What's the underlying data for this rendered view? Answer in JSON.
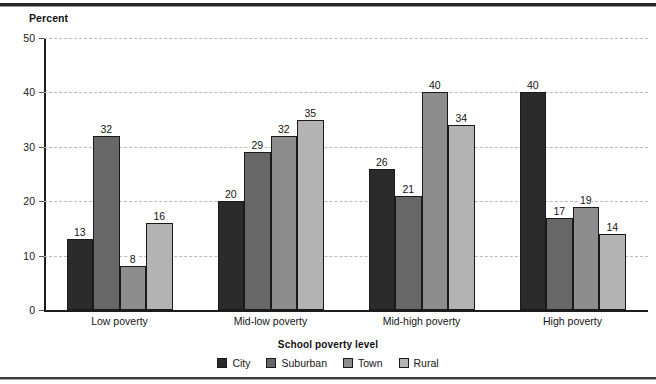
{
  "chart_data": {
    "type": "bar",
    "title": "",
    "ylabel": "Percent",
    "xlabel": "School poverty level",
    "ylim": [
      0,
      50
    ],
    "yticks": [
      0,
      10,
      20,
      30,
      40,
      50
    ],
    "grid": "horizontal-dashed",
    "legend_position": "bottom-center",
    "legend_title": "School poverty level",
    "categories": [
      "Low poverty",
      "Mid-low poverty",
      "Mid-high poverty",
      "High poverty"
    ],
    "series": [
      {
        "name": "City",
        "color": "#2b2b2b",
        "values": [
          13,
          20,
          26,
          40
        ]
      },
      {
        "name": "Suburban",
        "color": "#676767",
        "values": [
          32,
          29,
          21,
          17
        ]
      },
      {
        "name": "Town",
        "color": "#8d8d8d",
        "values": [
          8,
          32,
          40,
          19
        ]
      },
      {
        "name": "Rural",
        "color": "#b3b3b3",
        "values": [
          16,
          35,
          34,
          14
        ]
      }
    ]
  },
  "axis": {
    "y_title": "Percent",
    "tick_labels": [
      "0",
      "10",
      "20",
      "30",
      "40",
      "50"
    ]
  },
  "colors": {
    "axis": "#1c1c1c",
    "gridline": "#b9b9b9",
    "bar_outline": "#1a1a1a",
    "text": "#141414",
    "rule": "#262626"
  }
}
